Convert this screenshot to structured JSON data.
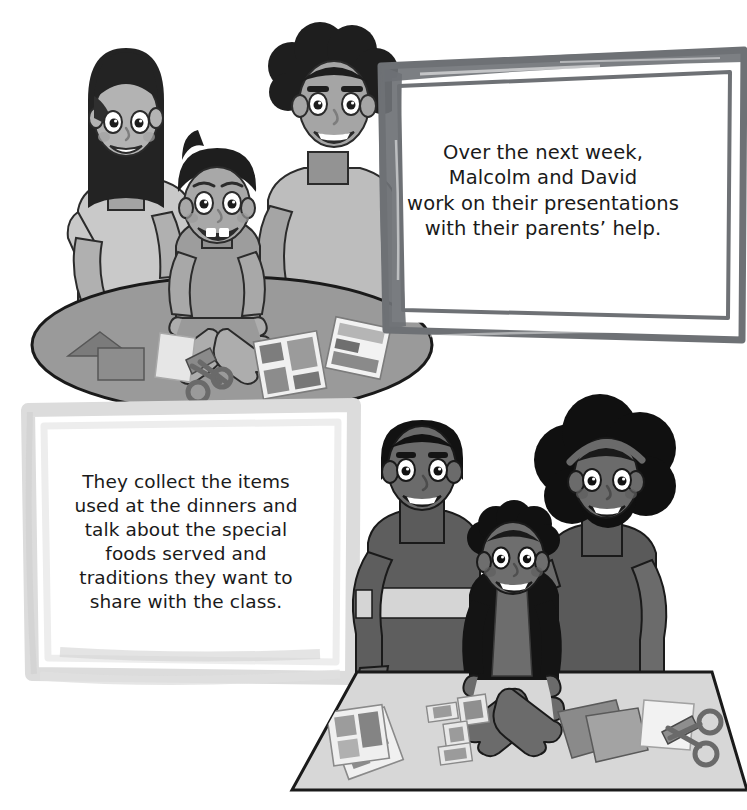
{
  "page": {
    "kind": "illustrated-storybook-page",
    "background_color": "#ffffff",
    "width": 747,
    "height": 810
  },
  "panels": [
    {
      "id": "panel-top",
      "caption_frame_style": "rough-brush-dark-gray-double-border",
      "caption_frame_color": "#6e7175",
      "caption_background": "#ffffff",
      "caption_text": "Over the next week,\nMalcolm and David\nwork on their presentations\nwith their parents’ help.",
      "scene": {
        "name": "family-at-round-table",
        "table_shape": "ellipse",
        "table_color": "#9a9a9a",
        "figures": [
          {
            "name": "mother",
            "hair": "long-straight-dark",
            "skin": "#b3b3b3",
            "shirt": "#c9c9c9"
          },
          {
            "name": "boy",
            "hair": "short-dark",
            "skin": "#a8a8a8",
            "shirt": "#9d9d9d"
          },
          {
            "name": "father",
            "hair": "curly-dark",
            "skin": "#a5a5a5",
            "shirt": "#bdbdbd"
          }
        ],
        "table_items": [
          "paper-triangle-and-rectangle",
          "white-paper-sheet",
          "scissors",
          "photo-collage-card",
          "photo-collage-card"
        ]
      }
    },
    {
      "id": "panel-bottom",
      "caption_frame_style": "soft-light-gray-border",
      "caption_frame_color": "#dcdcdc",
      "caption_background": "#ffffff",
      "caption_text": "They collect the items\nused at the dinners and\ntalk about the special\nfoods served and\ntraditions they want to\nshare with the class.",
      "scene": {
        "name": "family-at-rectangular-table",
        "table_shape": "trapezoid",
        "table_color": "#d7d7d7",
        "figures": [
          {
            "name": "father",
            "hair": "short-cropped-black",
            "skin": "#6b6b6b",
            "shirt": "#5e5e5e"
          },
          {
            "name": "boy",
            "hair": "curly-black",
            "skin": "#6e6e6e",
            "shirt": "#1c1c1c"
          },
          {
            "name": "mother",
            "hair": "afro-black-with-headband",
            "skin": "#6b6b6b",
            "shirt": "#5a5a5a"
          }
        ],
        "table_items": [
          "photo-collage-card",
          "photo-collage-card",
          "paper-squares",
          "folded-colored-paper",
          "white-paper-sheet",
          "scissors"
        ]
      }
    }
  ],
  "palette": {
    "ink": "#1a1a1a",
    "frame_dark": "#6e7175",
    "frame_light": "#dcdcdc",
    "table_top": "#9a9a9a",
    "table_bottom": "#d7d7d7",
    "skin_light": "#b0b0b0",
    "skin_dark": "#6b6b6b",
    "hair_black": "#1e1e1e",
    "white": "#ffffff"
  }
}
